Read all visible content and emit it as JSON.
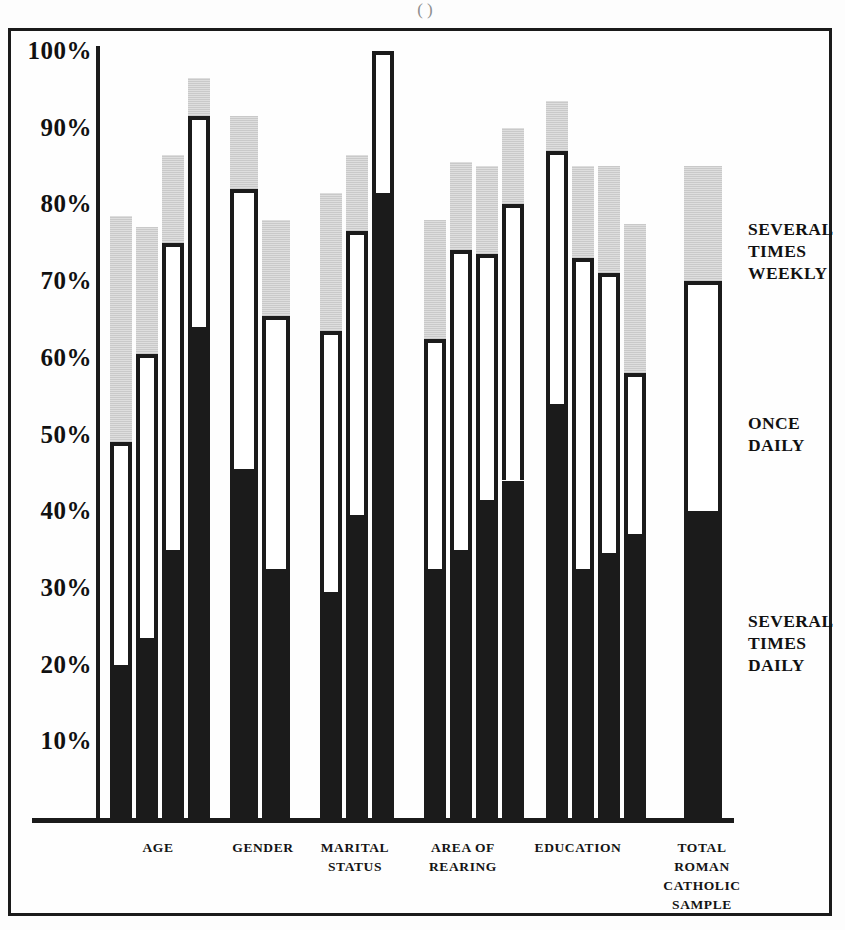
{
  "figure": {
    "top_fragment": "(                    )",
    "axis": {
      "y_ticks": [
        "100%",
        "90%",
        "80%",
        "70%",
        "60%",
        "50%",
        "40%",
        "30%",
        "20%",
        "10%"
      ],
      "y_min": 0,
      "y_max": 100
    }
  },
  "legend": {
    "items": [
      {
        "id": "several-times-weekly",
        "label": "SEVERAL\nTIMES\nWEEKLY",
        "line1": "SEVERAL",
        "line2": "TIMES",
        "line3": "WEEKLY",
        "color": "#d2d2d2"
      },
      {
        "id": "once-daily",
        "label": "ONCE\nDAILY",
        "line1": "ONCE",
        "line2": "DAILY",
        "line3": "",
        "color": "#ffffff"
      },
      {
        "id": "several-times-daily",
        "label": "SEVERAL\nTIMES\nDAILY",
        "line1": "SEVERAL",
        "line2": "TIMES",
        "line3": "DAILY",
        "color": "#1b1b1b"
      }
    ]
  },
  "groups": [
    {
      "id": "age",
      "line1": "AGE",
      "line2": "",
      "line3": "",
      "line4": ""
    },
    {
      "id": "gender",
      "line1": "GENDER",
      "line2": "",
      "line3": "",
      "line4": ""
    },
    {
      "id": "marital-status",
      "line1": "MARITAL",
      "line2": "STATUS",
      "line3": "",
      "line4": ""
    },
    {
      "id": "area-of-rearing",
      "line1": "AREA OF",
      "line2": "REARING",
      "line3": "",
      "line4": ""
    },
    {
      "id": "education",
      "line1": "EDUCATION",
      "line2": "",
      "line3": "",
      "line4": ""
    },
    {
      "id": "total-roman-catholic-sample",
      "line1": "TOTAL",
      "line2": "ROMAN",
      "line3": "CATHOLIC",
      "line4": "SAMPLE"
    }
  ],
  "chart_data": {
    "type": "bar",
    "subtype": "stacked-vertical",
    "title": "",
    "xlabel": "",
    "ylabel": "",
    "ylim": [
      0,
      100
    ],
    "grid": false,
    "legend_position": "right",
    "unit": "%",
    "series": [
      {
        "name": "SEVERAL TIMES DAILY",
        "color": "#1b1b1b",
        "values": [
          20,
          23.5,
          35,
          64,
          45.5,
          32.5,
          29.5,
          39.5,
          81.5,
          32.5,
          35,
          41.5,
          44,
          54,
          32.5,
          34.5,
          37,
          40
        ]
      },
      {
        "name": "ONCE DAILY",
        "color": "#ffffff",
        "values": [
          49,
          60.5,
          75,
          91.5,
          82,
          65.5,
          63.5,
          76.5,
          100,
          62.5,
          74,
          73.5,
          80,
          87,
          73,
          71,
          58,
          70
        ]
      },
      {
        "name": "SEVERAL TIMES WEEKLY",
        "color": "#d2d2d2",
        "values": [
          78.5,
          77,
          86.5,
          96.5,
          91.5,
          78,
          81.5,
          86.5,
          100,
          78,
          85.5,
          85,
          90,
          93.5,
          85,
          85,
          77.5,
          85
        ]
      }
    ],
    "bars": [
      {
        "group": "AGE",
        "index": 0,
        "several_times_daily": 20,
        "once_daily_top": 49,
        "several_times_weekly_top": 78.5
      },
      {
        "group": "AGE",
        "index": 1,
        "several_times_daily": 23.5,
        "once_daily_top": 60.5,
        "several_times_weekly_top": 77
      },
      {
        "group": "AGE",
        "index": 2,
        "several_times_daily": 35,
        "once_daily_top": 75,
        "several_times_weekly_top": 86.5
      },
      {
        "group": "AGE",
        "index": 3,
        "several_times_daily": 64,
        "once_daily_top": 91.5,
        "several_times_weekly_top": 96.5
      },
      {
        "group": "GENDER",
        "index": 0,
        "several_times_daily": 45.5,
        "once_daily_top": 82,
        "several_times_weekly_top": 91.5
      },
      {
        "group": "GENDER",
        "index": 1,
        "several_times_daily": 32.5,
        "once_daily_top": 65.5,
        "several_times_weekly_top": 78
      },
      {
        "group": "MARITAL STATUS",
        "index": 0,
        "several_times_daily": 29.5,
        "once_daily_top": 63.5,
        "several_times_weekly_top": 81.5
      },
      {
        "group": "MARITAL STATUS",
        "index": 1,
        "several_times_daily": 39.5,
        "once_daily_top": 76.5,
        "several_times_weekly_top": 86.5
      },
      {
        "group": "MARITAL STATUS",
        "index": 2,
        "several_times_daily": 81.5,
        "once_daily_top": 100,
        "several_times_weekly_top": 100
      },
      {
        "group": "AREA OF REARING",
        "index": 0,
        "several_times_daily": 32.5,
        "once_daily_top": 62.5,
        "several_times_weekly_top": 78
      },
      {
        "group": "AREA OF REARING",
        "index": 1,
        "several_times_daily": 35,
        "once_daily_top": 74,
        "several_times_weekly_top": 85.5
      },
      {
        "group": "AREA OF REARING",
        "index": 2,
        "several_times_daily": 41.5,
        "once_daily_top": 73.5,
        "several_times_weekly_top": 85
      },
      {
        "group": "AREA OF REARING",
        "index": 3,
        "several_times_daily": 44,
        "once_daily_top": 80,
        "several_times_weekly_top": 90
      },
      {
        "group": "EDUCATION",
        "index": 0,
        "several_times_daily": 54,
        "once_daily_top": 87,
        "several_times_weekly_top": 93.5
      },
      {
        "group": "EDUCATION",
        "index": 1,
        "several_times_daily": 32.5,
        "once_daily_top": 73,
        "several_times_weekly_top": 85
      },
      {
        "group": "EDUCATION",
        "index": 2,
        "several_times_daily": 34.5,
        "once_daily_top": 71,
        "several_times_weekly_top": 85
      },
      {
        "group": "EDUCATION",
        "index": 3,
        "several_times_daily": 37,
        "once_daily_top": 58,
        "several_times_weekly_top": 77.5
      },
      {
        "group": "TOTAL ROMAN CATHOLIC SAMPLE",
        "index": 0,
        "several_times_daily": 40,
        "once_daily_top": 70,
        "several_times_weekly_top": 85
      }
    ]
  },
  "layout": {
    "baseline_y": 818,
    "pct_to_px": 7.67,
    "bar_x": [
      110,
      136,
      162,
      188,
      230,
      262,
      320,
      346,
      372,
      424,
      450,
      476,
      502,
      546,
      572,
      598,
      624,
      684
    ],
    "bar_width": [
      22,
      22,
      22,
      22,
      28,
      28,
      22,
      22,
      22,
      22,
      22,
      22,
      22,
      22,
      22,
      22,
      22,
      38
    ],
    "group_label_x": [
      108,
      208,
      300,
      408,
      518,
      652
    ],
    "group_label_w": [
      100,
      110,
      110,
      110,
      120,
      100
    ]
  }
}
